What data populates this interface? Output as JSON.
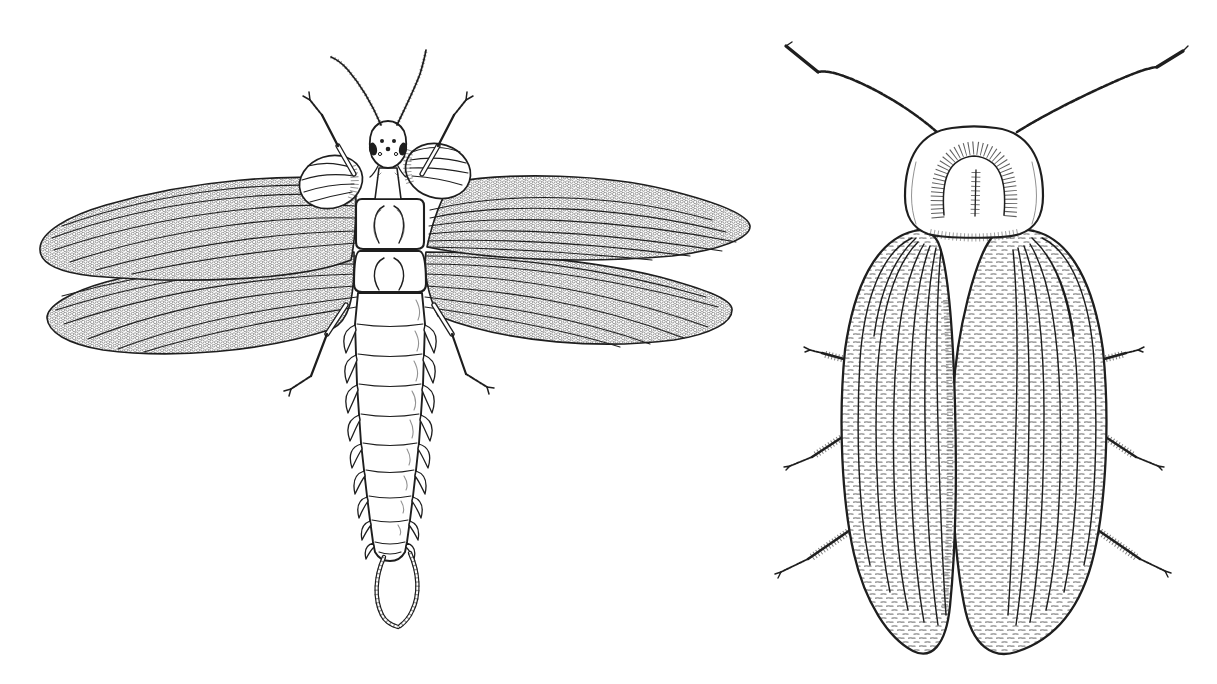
{
  "canvas": {
    "width": 1217,
    "height": 684,
    "background": "#ffffff",
    "ink": "#1e1e1e",
    "shade": "#4a4a4a"
  },
  "plate": {
    "type": "Pen-and-ink scientific illustration plate of two insects, dorsal views, on white background",
    "text_labels": [],
    "figures": [
      {
        "position": "left",
        "subject": "Primitive winged insect (palaeodictyopteran-like), dorsal view with outspread wings",
        "features": [
          "two thin beaded antennae curving upward",
          "small head with dark lateral eyes and ocelli spots",
          "forelegs spread up-and-outward ending in tiny claws",
          "pair of small oval winglets on the prothorax with radiating veinlets",
          "two boxy thorax segments with paired muscle bulges",
          "two pairs of long outspread membranous wings filled with fine mesh (archedictyon) venation",
          "segmented tapering abdomen, each segment bearing small leaf-like lateral lobes",
          "pair of hind legs angled down beneath the hindwings",
          "two long ringed cerci forming a narrow fork at the tail tip"
        ]
      },
      {
        "position": "right",
        "subject": "Cockroach-like insect, dorsal view with wings folded over the back",
        "features": [
          "two long beaded antennae swept up and outward, darker toward the tips",
          "broad rounded pronotal shield with a hairy horseshoe marking and central feathered line",
          "two leathery forewings folded roof-like over the body, overlapping along the midline",
          "fanned longitudinal wing veins crossed by dense ladder-like cross-veins",
          "three pairs of spiny legs projecting from beneath the wing margins"
        ]
      }
    ]
  }
}
